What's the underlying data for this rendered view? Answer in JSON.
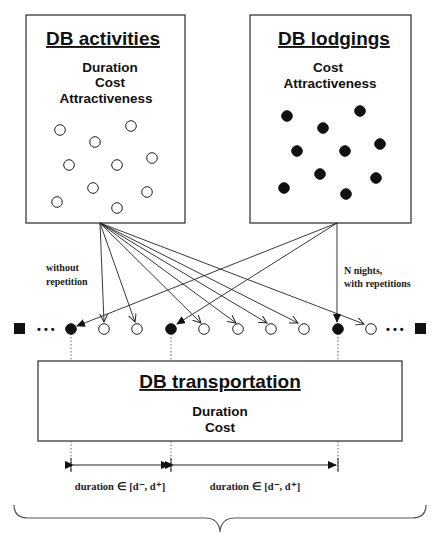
{
  "boxes": {
    "activities": {
      "title": "DB activities",
      "attributes": [
        "Duration",
        "Cost",
        "Attractiveness"
      ],
      "item_style": "open-circle",
      "item_count": 10
    },
    "lodgings": {
      "title": "DB lodgings",
      "attributes": [
        "Cost",
        "Attractiveness"
      ],
      "item_style": "filled-circle",
      "item_count": 10
    },
    "transportation": {
      "title": "DB transportation",
      "attributes": [
        "Duration",
        "Cost"
      ]
    }
  },
  "annotations": {
    "activities_note_line1": "without",
    "activities_note_line2": "repetition",
    "lodgings_note_line1": "N nights,",
    "lodgings_note_line2": "with repetitions"
  },
  "sequence": {
    "start_marker": "filled-square",
    "end_marker": "filled-square",
    "ellipsis": "• • •",
    "nodes": [
      "lodging",
      "activity",
      "activity",
      "lodging",
      "activity",
      "activity",
      "activity",
      "activity",
      "lodging",
      "activity"
    ]
  },
  "intervals": [
    {
      "label": "duration ∈ [d⁻, d⁺]"
    },
    {
      "label": "duration ∈ [d⁻, d⁺]"
    }
  ],
  "colors": {
    "stroke": "#222222",
    "filled": "#111111",
    "background": "#ffffff"
  }
}
